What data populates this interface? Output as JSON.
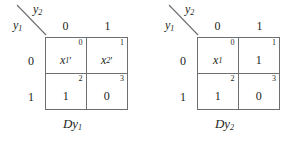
{
  "figure": {
    "maps": [
      {
        "id": "left",
        "axis": {
          "row_var": "y",
          "row_var_sub": "1",
          "col_var": "y",
          "col_var_sub": "2"
        },
        "column_headers": [
          "0",
          "1"
        ],
        "row_headers": [
          "0",
          "1"
        ],
        "cells": [
          {
            "index": "0",
            "value": "x",
            "value_sub": "1",
            "prime": "′",
            "is_expression": true
          },
          {
            "index": "1",
            "value": "x",
            "value_sub": "2",
            "prime": "′",
            "is_expression": true
          },
          {
            "index": "2",
            "value": "1",
            "value_sub": "",
            "prime": "",
            "is_expression": false
          },
          {
            "index": "3",
            "value": "0",
            "value_sub": "",
            "prime": "",
            "is_expression": false
          }
        ],
        "caption": "Dy",
        "caption_sub": "1"
      },
      {
        "id": "right",
        "axis": {
          "row_var": "y",
          "row_var_sub": "1",
          "col_var": "y",
          "col_var_sub": "2"
        },
        "column_headers": [
          "0",
          "1"
        ],
        "row_headers": [
          "0",
          "1"
        ],
        "cells": [
          {
            "index": "0",
            "value": "x",
            "value_sub": "1",
            "prime": "",
            "is_expression": true
          },
          {
            "index": "1",
            "value": "1",
            "value_sub": "",
            "prime": "",
            "is_expression": false
          },
          {
            "index": "2",
            "value": "1",
            "value_sub": "",
            "prime": "",
            "is_expression": false
          },
          {
            "index": "3",
            "value": "0",
            "value_sub": "",
            "prime": "",
            "is_expression": false
          }
        ],
        "caption": "Dy",
        "caption_sub": "2"
      }
    ],
    "colors": {
      "line": "#6d6e71",
      "text": "#231f20",
      "background": "#ffffff"
    }
  }
}
